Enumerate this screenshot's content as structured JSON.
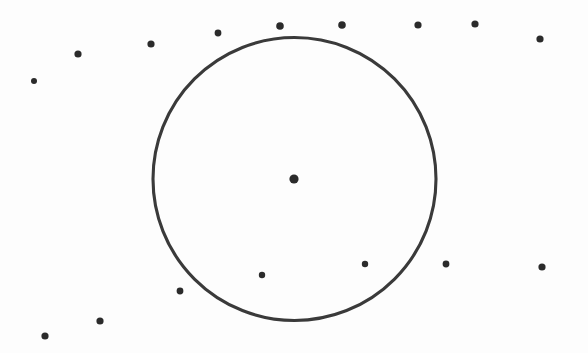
{
  "figure": {
    "title": "Circle with scattered points",
    "width": 588,
    "height": 353,
    "background_color": "#fdfdfd",
    "ink_color": "#3a3a3a",
    "style": "scanned bitmap line drawing"
  },
  "chart_data": {
    "type": "scatter",
    "title": "Circle with scattered points",
    "subtitle": "",
    "xlabel": "",
    "ylabel": "",
    "grid": false,
    "legend": false,
    "axes_visible": false,
    "tick_labels": [],
    "annotations": [],
    "xlim": [
      0,
      588
    ],
    "ylim": [
      0,
      353
    ],
    "coordinate_note": "Pixel coordinates, origin at top-left of the 588x353 image.",
    "shapes": [
      {
        "name": "main-circle",
        "type": "circle",
        "cx": 294.5,
        "cy": 179,
        "r": 141.5,
        "fill": "none",
        "stroke": "#3a3a3a",
        "stroke_width": 3.1
      }
    ],
    "series": [
      {
        "name": "center-point",
        "marker": "filled-circle",
        "color": "#2b2b2b",
        "marker_size": 9,
        "points": [
          {
            "x": 294,
            "y": 179,
            "r": 4.6,
            "region": "center"
          }
        ]
      },
      {
        "name": "outside-points",
        "marker": "filled-circle",
        "color": "#2b2b2b",
        "marker_size": 7,
        "points": [
          {
            "x": 34,
            "y": 81,
            "r": 3.0,
            "region": "outside"
          },
          {
            "x": 78,
            "y": 54,
            "r": 3.6,
            "region": "outside"
          },
          {
            "x": 151,
            "y": 44,
            "r": 3.6,
            "region": "outside"
          },
          {
            "x": 218,
            "y": 33,
            "r": 3.4,
            "region": "outside"
          },
          {
            "x": 280,
            "y": 26,
            "r": 3.8,
            "region": "outside"
          },
          {
            "x": 342,
            "y": 25,
            "r": 3.8,
            "region": "outside"
          },
          {
            "x": 418,
            "y": 25,
            "r": 3.6,
            "region": "outside"
          },
          {
            "x": 475,
            "y": 24,
            "r": 3.6,
            "region": "outside"
          },
          {
            "x": 540,
            "y": 39,
            "r": 3.6,
            "region": "outside"
          },
          {
            "x": 542,
            "y": 267,
            "r": 3.6,
            "region": "outside"
          },
          {
            "x": 446,
            "y": 264,
            "r": 3.4,
            "region": "outside"
          },
          {
            "x": 180,
            "y": 291,
            "r": 3.4,
            "region": "outside"
          },
          {
            "x": 100,
            "y": 321,
            "r": 3.6,
            "region": "outside"
          },
          {
            "x": 45,
            "y": 336,
            "r": 3.6,
            "region": "outside"
          }
        ]
      },
      {
        "name": "inside-points",
        "marker": "filled-circle",
        "color": "#2b2b2b",
        "marker_size": 6,
        "points": [
          {
            "x": 262,
            "y": 275,
            "r": 3.2,
            "region": "inside"
          },
          {
            "x": 365,
            "y": 264,
            "r": 3.2,
            "region": "inside"
          }
        ]
      }
    ],
    "counts": {
      "total_points": 17,
      "center_points": 1,
      "inside_points": 2,
      "outside_points": 14
    }
  }
}
